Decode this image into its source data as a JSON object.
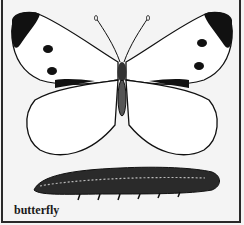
{
  "illustration": {
    "subject": "butterfly",
    "caption": "butterfly",
    "elements": [
      "butterfly-adult",
      "caterpillar-larva"
    ],
    "colors": {
      "ink": "#111111",
      "paper": "#f4f4f4"
    }
  }
}
